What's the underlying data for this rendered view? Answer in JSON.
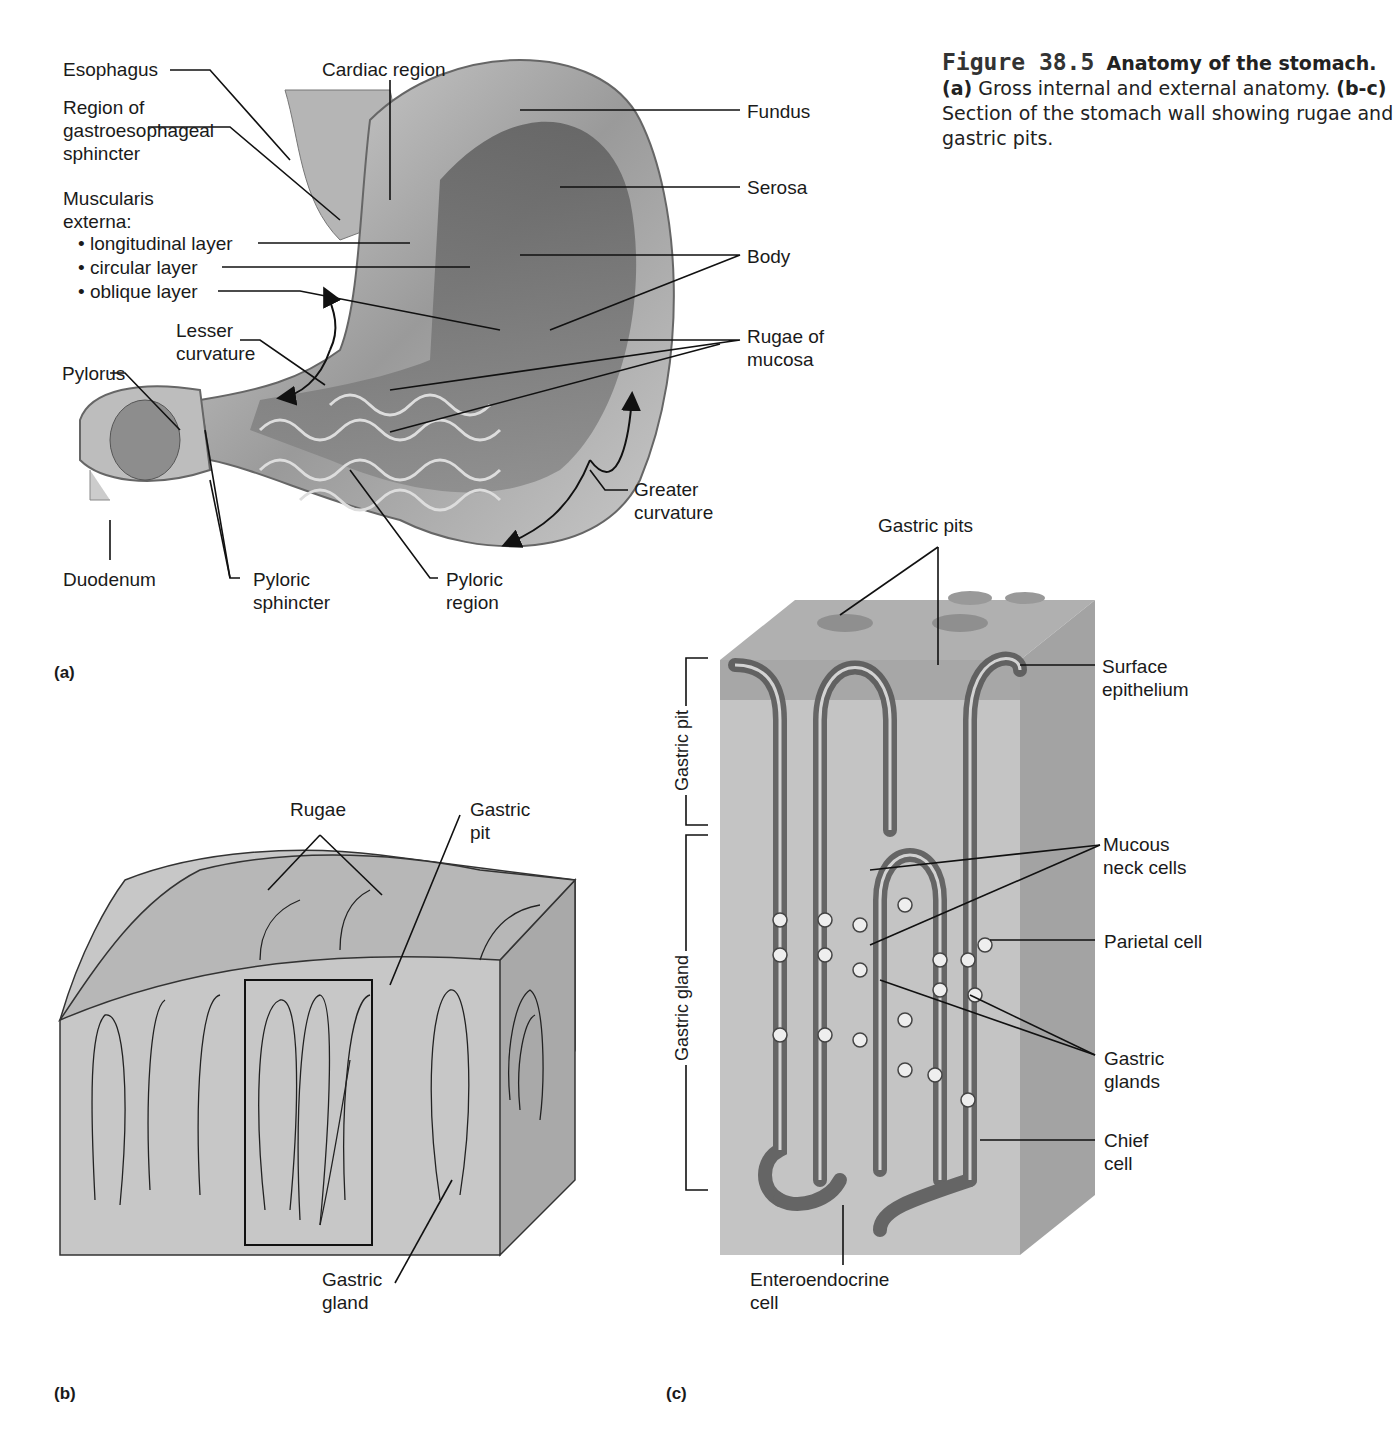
{
  "caption": {
    "figure_number": "Figure 38.5",
    "title": "Anatomy of the stomach.",
    "part_a_tag": "(a)",
    "part_a_text": "Gross internal and external anatomy.",
    "part_bc_tag": "(b-c)",
    "part_bc_text": "Section of the stomach wall showing rugae and gastric pits."
  },
  "panel_a": {
    "tag": "(a)",
    "labels": {
      "esophagus": "Esophagus",
      "cardiac_region": "Cardiac region",
      "gastroesophageal": "Region of\ngastroesophageal\nsphincter",
      "muscularis": "Muscularis\nexterna:",
      "longitudinal": "• longitudinal layer",
      "circular": "• circular layer",
      "oblique": "• oblique layer",
      "lesser_curvature": "Lesser\ncurvature",
      "pylorus": "Pylorus",
      "duodenum": "Duodenum",
      "pyloric_sphincter": "Pyloric\nsphincter",
      "pyloric_region": "Pyloric\nregion",
      "greater_curvature": "Greater\ncurvature",
      "fundus": "Fundus",
      "serosa": "Serosa",
      "body": "Body",
      "rugae_of_mucosa": "Rugae of\nmucosa"
    }
  },
  "panel_b": {
    "tag": "(b)",
    "labels": {
      "rugae": "Rugae",
      "gastric_pit": "Gastric\npit",
      "gastric_gland": "Gastric\ngland"
    }
  },
  "panel_c": {
    "tag": "(c)",
    "labels": {
      "gastric_pits": "Gastric pits",
      "surface_epithelium": "Surface\nepithelium",
      "mucous_neck_cells": "Mucous\nneck cells",
      "parietal_cell": "Parietal cell",
      "gastric_glands": "Gastric\nglands",
      "chief_cell": "Chief\ncell",
      "enteroendocrine_cell": "Enteroendocrine\ncell",
      "gastric_pit_bracket": "Gastric pit",
      "gastric_gland_bracket": "Gastric gland"
    }
  }
}
